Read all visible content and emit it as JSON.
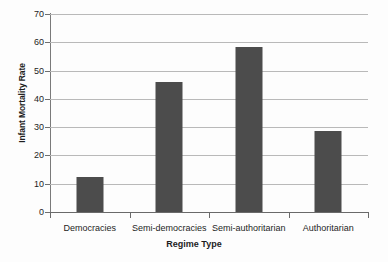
{
  "chart_data": {
    "type": "bar",
    "title": "",
    "xlabel": "Regime Type",
    "ylabel": "Infant Mortality Rate",
    "categories": [
      "Democracies",
      "Semi-democracies",
      "Semi-authoritarian",
      "Authoritarian"
    ],
    "values": [
      12.5,
      46,
      58.5,
      28.5
    ],
    "ylim": [
      0,
      70
    ],
    "yticks": [
      0,
      10,
      20,
      30,
      40,
      50,
      60,
      70
    ],
    "ytick_labels": [
      "0",
      "10",
      "20",
      "30",
      "40",
      "50",
      "60",
      "70"
    ],
    "grid": true,
    "legend": false,
    "bar_color": "#4c4c4c",
    "gridline_color": "#b9b9b9",
    "axis_color": "#6a6a6a",
    "background": "#ffffff"
  }
}
